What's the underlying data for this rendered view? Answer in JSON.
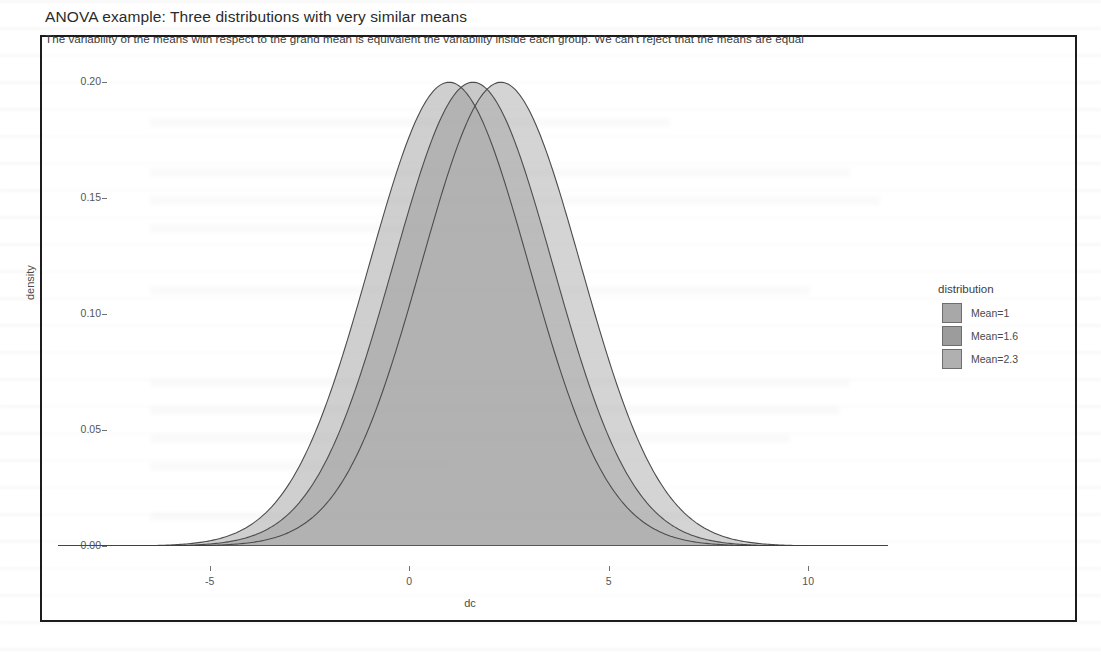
{
  "figure": {
    "title": "ANOVA example: Three distributions with very similar means",
    "subtitle": "The variability of the means with respect to the grand mean is equivalent the variability inside each group. We can't reject that the means are equal"
  },
  "legend": {
    "title": "distribution",
    "items": [
      {
        "label": "Mean=1",
        "swatch_color": "#a8a8a8",
        "icon": "legend-swatch-icon"
      },
      {
        "label": "Mean=1.6",
        "swatch_color": "#9c9c9c",
        "icon": "legend-swatch-icon"
      },
      {
        "label": "Mean=2.3",
        "swatch_color": "#b0b0b0",
        "icon": "legend-swatch-icon"
      }
    ]
  },
  "chart_data": {
    "type": "area",
    "title": "ANOVA example: Three distributions with very similar means",
    "subtitle": "The variability of the means with respect to the grand mean is equivalent the variability inside each group. We can't reject that the means are equal",
    "xlabel": "dc",
    "ylabel": "density",
    "xlim": [
      -8.8,
      12.0
    ],
    "ylim": [
      0.0,
      0.207
    ],
    "xticks": [
      -5,
      0,
      5,
      10
    ],
    "xtick_labels": [
      "-5",
      "0",
      "5",
      "10"
    ],
    "yticks": [
      0.0,
      0.05,
      0.1,
      0.15,
      0.2
    ],
    "ytick_labels": [
      "0.00",
      "0.05",
      "0.10",
      "0.15",
      "0.20"
    ],
    "grid": false,
    "legend_position": "right",
    "legend_title": "distribution",
    "distribution_shape": "normal-density",
    "series": [
      {
        "name": "Mean=1",
        "mean": 1.0,
        "sd": 2.0,
        "peak_density": 0.2,
        "fill_color": "#a8a8a8",
        "fill_opacity": 0.55,
        "line_color": "#4d4d4d"
      },
      {
        "name": "Mean=1.6",
        "mean": 1.6,
        "sd": 2.0,
        "peak_density": 0.2,
        "fill_color": "#9c9c9c",
        "fill_opacity": 0.55,
        "line_color": "#4d4d4d"
      },
      {
        "name": "Mean=2.3",
        "mean": 2.3,
        "sd": 2.0,
        "peak_density": 0.2,
        "fill_color": "#b0b0b0",
        "fill_opacity": 0.55,
        "line_color": "#4d4d4d"
      }
    ]
  }
}
